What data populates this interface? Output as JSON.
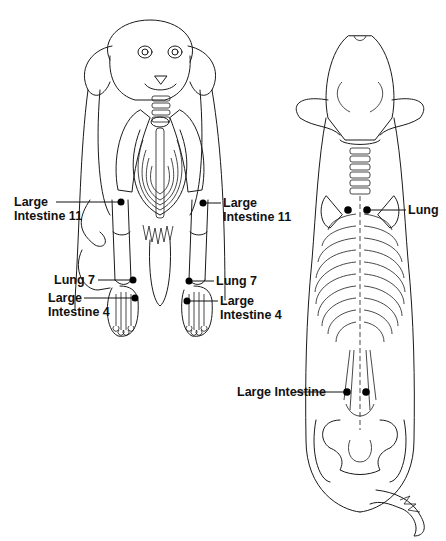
{
  "figure": {
    "colors": {
      "line": "#1a1a1a",
      "point": "#000000",
      "background": "#ffffff"
    },
    "front_view": {
      "labels": [
        {
          "id": "li11-left",
          "line1": "Large",
          "line2": "Intestine 11",
          "x": 14,
          "y": 196,
          "align": "left"
        },
        {
          "id": "li11-right",
          "line1": "Large",
          "line2": "Intestine 11",
          "x": 222,
          "y": 196,
          "align": "left"
        },
        {
          "id": "lu7-left",
          "line1": "Lung 7",
          "line2": "",
          "x": 54,
          "y": 275,
          "align": "left"
        },
        {
          "id": "lu7-right",
          "line1": "Lung 7",
          "line2": "",
          "x": 216,
          "y": 275,
          "align": "left"
        },
        {
          "id": "li4-left",
          "line1": "Large",
          "line2": "Intestine 4",
          "x": 48,
          "y": 292,
          "align": "left"
        },
        {
          "id": "li4-right",
          "line1": "Large",
          "line2": "Intestine 4",
          "x": 220,
          "y": 295,
          "align": "left"
        }
      ]
    },
    "dorsal_view": {
      "labels": [
        {
          "id": "lung-back",
          "line1": "Lung",
          "line2": "",
          "x": 408,
          "y": 202,
          "align": "left"
        },
        {
          "id": "li-back",
          "line1": "Large Intestine",
          "line2": "",
          "x": 237,
          "y": 385,
          "align": "left"
        }
      ]
    }
  }
}
